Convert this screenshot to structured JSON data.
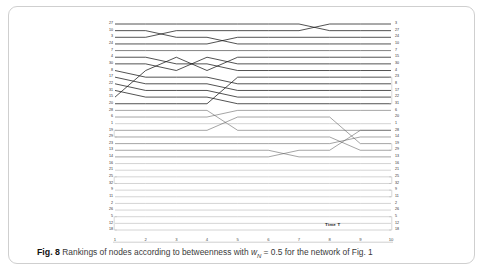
{
  "figure": {
    "number": "Fig. 8",
    "caption_pre": "Rankings of nodes according to betweenness with ",
    "caption_symbol": "w",
    "caption_subscript": "N",
    "caption_post": " = 0.5 for the network of Fig. 1",
    "caption_full": "Fig. 8 Rankings of nodes according to betweenness with wN = 0.5 for the network of Fig. 1"
  },
  "axis": {
    "x_label": "Time T",
    "x_ticks": [
      "1",
      "2",
      "3",
      "4",
      "5",
      "6",
      "7",
      "8",
      "9",
      "10"
    ]
  },
  "colors": {
    "card_border": "#cfcfcf",
    "line_dark": "#1a1a1a",
    "line_mid": "#5a5a5a",
    "line_light": "#b0b0b0",
    "text": "#2b2b2b",
    "background": "#ffffff"
  },
  "chart_data": {
    "type": "line",
    "title": "Rankings of nodes according to betweenness with wN = 0.5 for the network of Fig. 1",
    "xlabel": "Time T",
    "ylabel": "",
    "grid": false,
    "legend": "none",
    "x": [
      1,
      2,
      3,
      4,
      5,
      6,
      7,
      8,
      9,
      10
    ],
    "xlim": [
      1,
      10
    ],
    "ylim": [
      1,
      32
    ],
    "y_inverted": true,
    "left_labels": [
      "27",
      "10",
      "3",
      "24",
      "7",
      "4",
      "30",
      "8",
      "17",
      "22",
      "31",
      "15",
      "20",
      "28",
      "6",
      "1",
      "19",
      "29",
      "23",
      "13",
      "14",
      "16",
      "21",
      "25",
      "32",
      "9",
      "11",
      "2",
      "26",
      "5",
      "12",
      "18"
    ],
    "right_labels": [
      "3",
      "27",
      "24",
      "10",
      "7",
      "15",
      "30",
      "4",
      "23",
      "8",
      "17",
      "22",
      "31",
      "6",
      "20",
      "1",
      "28",
      "14",
      "19",
      "29",
      "13",
      "16",
      "21",
      "25",
      "32",
      "9",
      "11",
      "2",
      "26",
      "5",
      "12",
      "18"
    ],
    "series": [
      {
        "name": "27",
        "values": [
          1,
          1,
          1,
          1,
          1,
          1,
          1,
          2,
          2,
          2
        ]
      },
      {
        "name": "10",
        "values": [
          2,
          2,
          3,
          3,
          4,
          4,
          4,
          4,
          4,
          4
        ]
      },
      {
        "name": "3",
        "values": [
          3,
          3,
          2,
          2,
          2,
          2,
          2,
          1,
          1,
          1
        ]
      },
      {
        "name": "24",
        "values": [
          4,
          4,
          4,
          4,
          3,
          3,
          3,
          3,
          3,
          3
        ]
      },
      {
        "name": "7",
        "values": [
          5,
          5,
          5,
          5,
          5,
          5,
          5,
          5,
          5,
          5
        ]
      },
      {
        "name": "4",
        "values": [
          6,
          6,
          7,
          7,
          8,
          8,
          8,
          8,
          8,
          8
        ]
      },
      {
        "name": "30",
        "values": [
          7,
          7,
          8,
          6,
          7,
          7,
          7,
          7,
          7,
          7
        ]
      },
      {
        "name": "8",
        "values": [
          8,
          9,
          9,
          9,
          10,
          10,
          10,
          10,
          10,
          10
        ]
      },
      {
        "name": "17",
        "values": [
          9,
          10,
          10,
          10,
          11,
          11,
          11,
          11,
          11,
          11
        ]
      },
      {
        "name": "22",
        "values": [
          10,
          11,
          11,
          11,
          12,
          12,
          12,
          12,
          12,
          12
        ]
      },
      {
        "name": "31",
        "values": [
          11,
          12,
          12,
          12,
          13,
          13,
          13,
          13,
          13,
          13
        ]
      },
      {
        "name": "15",
        "values": [
          12,
          8,
          6,
          8,
          6,
          6,
          6,
          6,
          6,
          6
        ]
      },
      {
        "name": "20",
        "values": [
          13,
          13,
          13,
          13,
          9,
          9,
          9,
          9,
          9,
          9
        ]
      },
      {
        "name": "28",
        "values": [
          14,
          14,
          14,
          14,
          17,
          17,
          17,
          17,
          17,
          17
        ]
      },
      {
        "name": "6",
        "values": [
          15,
          15,
          15,
          15,
          14,
          14,
          14,
          14,
          14,
          14
        ]
      },
      {
        "name": "1",
        "values": [
          16,
          16,
          16,
          16,
          16,
          16,
          16,
          16,
          16,
          16
        ]
      },
      {
        "name": "19",
        "values": [
          17,
          17,
          17,
          17,
          15,
          15,
          15,
          15,
          19,
          19
        ]
      },
      {
        "name": "29",
        "values": [
          18,
          18,
          18,
          18,
          18,
          18,
          18,
          18,
          20,
          20
        ]
      },
      {
        "name": "23",
        "values": [
          19,
          19,
          19,
          19,
          19,
          19,
          19,
          19,
          18,
          18
        ]
      },
      {
        "name": "13",
        "values": [
          20,
          20,
          20,
          20,
          20,
          20,
          21,
          21,
          21,
          21
        ]
      },
      {
        "name": "14",
        "values": [
          21,
          21,
          21,
          21,
          21,
          21,
          20,
          20,
          17,
          17
        ]
      },
      {
        "name": "16",
        "values": [
          22,
          22,
          22,
          22,
          22,
          22,
          22,
          22,
          22,
          22
        ]
      },
      {
        "name": "21",
        "values": [
          23,
          23,
          23,
          23,
          23,
          23,
          23,
          23,
          23,
          23
        ]
      },
      {
        "name": "25",
        "values": [
          24,
          24,
          24,
          24,
          24,
          24,
          24,
          24,
          24,
          24
        ]
      },
      {
        "name": "32",
        "values": [
          25,
          25,
          25,
          25,
          25,
          25,
          25,
          25,
          25,
          25
        ]
      },
      {
        "name": "9",
        "values": [
          26,
          26,
          26,
          26,
          26,
          26,
          26,
          26,
          26,
          26
        ]
      },
      {
        "name": "11",
        "values": [
          27,
          27,
          27,
          27,
          27,
          27,
          27,
          27,
          27,
          27
        ]
      },
      {
        "name": "2",
        "values": [
          28,
          28,
          28,
          28,
          28,
          28,
          28,
          28,
          28,
          28
        ]
      },
      {
        "name": "26",
        "values": [
          29,
          29,
          29,
          29,
          29,
          29,
          29,
          29,
          29,
          29
        ]
      },
      {
        "name": "5",
        "values": [
          30,
          30,
          30,
          30,
          30,
          30,
          30,
          30,
          30,
          30
        ]
      },
      {
        "name": "12",
        "values": [
          31,
          31,
          31,
          31,
          31,
          31,
          31,
          31,
          31,
          31
        ]
      },
      {
        "name": "18",
        "values": [
          32,
          32,
          32,
          32,
          32,
          32,
          32,
          32,
          32,
          32
        ]
      }
    ],
    "tie_brackets_left": [
      [
        17,
        18
      ],
      [
        24,
        25
      ],
      [
        30,
        32
      ]
    ],
    "tie_brackets_right": [
      [
        9,
        13
      ],
      [
        19,
        20
      ],
      [
        24,
        25
      ],
      [
        26,
        27
      ],
      [
        30,
        32
      ]
    ]
  }
}
